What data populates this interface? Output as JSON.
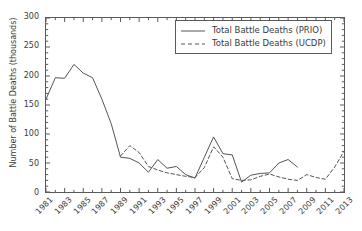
{
  "chart_data": {
    "type": "line",
    "title": "",
    "xlabel": "",
    "ylabel": "Number of Battle Deaths (thousands)",
    "xlim": [
      1981,
      2013
    ],
    "ylim": [
      0,
      300
    ],
    "ytick_labels": [
      "0",
      "50",
      "100",
      "150",
      "200",
      "250",
      "300"
    ],
    "ytick_values": [
      0,
      50,
      100,
      150,
      200,
      250,
      300
    ],
    "xtick_labels": [
      "1981",
      "1983",
      "1985",
      "1987",
      "1989",
      "1991",
      "1993",
      "1995",
      "1997",
      "1999",
      "2001",
      "2003",
      "2005",
      "2007",
      "2009",
      "2011",
      "2013"
    ],
    "xtick_values": [
      1981,
      1983,
      1985,
      1987,
      1989,
      1991,
      1993,
      1995,
      1997,
      1999,
      2001,
      2003,
      2005,
      2007,
      2009,
      2011,
      2013
    ],
    "grid": false,
    "minor_ticks": true,
    "legend_position": "upper right",
    "line_color": "#555555",
    "series": [
      {
        "name": "Total Battle Deaths (PRIO)",
        "style": "solid",
        "x": [
          1981,
          1982,
          1983,
          1984,
          1985,
          1986,
          1987,
          1988,
          1989,
          1990,
          1991,
          1992,
          1993,
          1994,
          1995,
          1996,
          1997,
          1998,
          1999,
          2000,
          2001,
          2002,
          2003,
          2004,
          2005,
          2006,
          2007,
          2008
        ],
        "values": [
          160,
          197,
          196,
          220,
          205,
          197,
          160,
          118,
          60,
          58,
          50,
          34,
          56,
          41,
          44,
          30,
          24,
          60,
          95,
          66,
          64,
          17,
          29,
          32,
          33,
          50,
          56,
          43
        ]
      },
      {
        "name": "Total Battle Deaths (UCDP)",
        "style": "dashed",
        "x": [
          1989,
          1990,
          1991,
          1992,
          1993,
          1994,
          1995,
          1996,
          1997,
          1998,
          1999,
          2000,
          2001,
          2002,
          2003,
          2004,
          2005,
          2006,
          2007,
          2008,
          2009,
          2010,
          2011,
          2012,
          2013
        ],
        "values": [
          62,
          80,
          68,
          44,
          38,
          33,
          30,
          27,
          25,
          42,
          78,
          60,
          23,
          20,
          21,
          27,
          31,
          26,
          22,
          20,
          30,
          25,
          22,
          43,
          70
        ]
      }
    ]
  },
  "legend": {
    "entries": [
      {
        "label": "Total Battle Deaths (PRIO)",
        "style": "solid"
      },
      {
        "label": "Total Battle Deaths (UCDP)",
        "style": "dashed"
      }
    ]
  }
}
